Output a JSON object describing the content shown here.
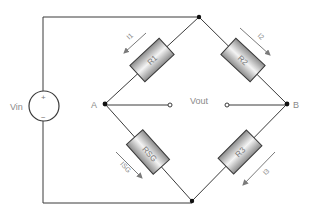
{
  "diagram": {
    "type": "wheatstone-bridge",
    "source": {
      "label": "Vin",
      "plus": "+",
      "minus": "−"
    },
    "nodes": {
      "a": "A",
      "b": "B"
    },
    "output": {
      "label": "Vout"
    },
    "resistors": [
      {
        "id": "r1",
        "label": "R1",
        "current": "I1"
      },
      {
        "id": "r2",
        "label": "R2",
        "current": "I2"
      },
      {
        "id": "r3",
        "label": "R3",
        "current": "I3"
      },
      {
        "id": "rsg",
        "label": "RSG",
        "current": "ISG"
      }
    ]
  },
  "colors": {
    "wire": "#3a3a3a",
    "resistor_dark": "#8c8c8c",
    "resistor_light": "#f2f2f2",
    "label": "#8a8a8a",
    "arrow": "#7a7a7a"
  }
}
